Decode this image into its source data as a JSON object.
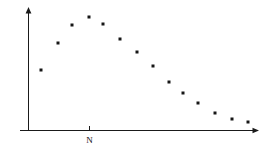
{
  "chart_data": {
    "type": "scatter",
    "title": "",
    "subtitle": "",
    "xlabel": "",
    "ylabel": "",
    "legend": [],
    "grid": false,
    "legend_position": "none",
    "xlim": [
      0,
      15.5
    ],
    "ylim": [
      0,
      100
    ],
    "x_tick_labels": [
      "N"
    ],
    "x_tick_values": [
      4
    ],
    "y_tick_labels": [],
    "annotations": [],
    "marker": {
      "shape": "square",
      "color": "#161616",
      "size_px": 3
    },
    "axes": {
      "x_axis_color": "#1a1a1a",
      "y_axis_color": "#1a1a1a",
      "x_axis_arrow": true,
      "y_axis_arrow": true
    },
    "series": [
      {
        "name": "series-1",
        "color": "#161616",
        "x": [
          1,
          2,
          3,
          4,
          5,
          6,
          7,
          8,
          9,
          10,
          11,
          12,
          13,
          14,
          15
        ],
        "y": [
          49,
          71,
          87,
          93,
          86,
          79,
          74,
          65,
          54,
          46,
          39,
          32,
          25,
          20,
          17
        ],
        "points_px": [
          {
            "x": 41,
            "y": 70
          },
          {
            "x": 58,
            "y": 43
          },
          {
            "x": 72,
            "y": 25
          },
          {
            "x": 89,
            "y": 17
          },
          {
            "x": 103,
            "y": 24
          },
          {
            "x": 120,
            "y": 39
          },
          {
            "x": 137,
            "y": 52
          },
          {
            "x": 153,
            "y": 66
          },
          {
            "x": 169,
            "y": 82
          },
          {
            "x": 183,
            "y": 93
          },
          {
            "x": 198,
            "y": 103
          },
          {
            "x": 215,
            "y": 113
          },
          {
            "x": 232,
            "y": 119
          },
          {
            "x": 248,
            "y": 122
          }
        ]
      }
    ]
  },
  "figure": {
    "x_axis_label_n": "N",
    "background_color": "#ffffff",
    "ink_color": "#161616"
  }
}
